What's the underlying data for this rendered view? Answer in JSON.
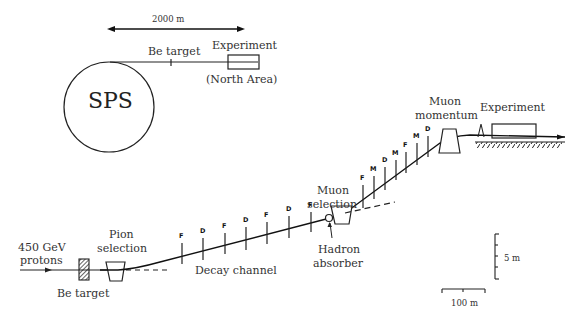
{
  "overview": {
    "distance_label": "2000 m",
    "accelerator_label": "SPS",
    "target_label": "Be target",
    "experiment_label": "Experiment",
    "area_label": "(North Area)"
  },
  "beamline": {
    "beam_label_line1": "450 GeV",
    "beam_label_line2": "protons",
    "target_label": "Be target",
    "pion_label_line1": "Pion",
    "pion_label_line2": "selection",
    "decay_label": "Decay channel",
    "muon_sel_line1": "Muon",
    "muon_sel_line2": "selection",
    "hadron_line1": "Hadron",
    "hadron_line2": "absorber",
    "muon_mom_line1": "Muon",
    "muon_mom_line2": "momentum",
    "experiment_label": "Experiment",
    "decay_magnets": [
      "F",
      "D",
      "F",
      "D",
      "F",
      "D",
      "F"
    ],
    "muon_magnets": [
      "F",
      "M",
      "D",
      "M",
      "F",
      "M",
      "D"
    ]
  },
  "scale": {
    "vertical_label": "5 m",
    "horizontal_label": "100 m"
  }
}
